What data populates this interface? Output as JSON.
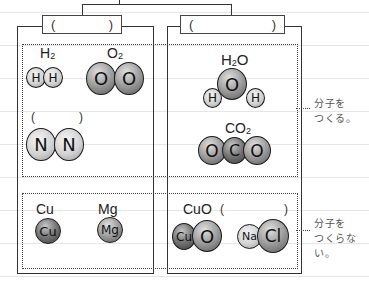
{
  "diagram": {
    "top_connector": "tree-branch",
    "left_column": {
      "header_blank": {
        "open": "(",
        "close": ")"
      },
      "molecule_section": {
        "items": [
          {
            "formula_main": "H",
            "formula_sub": "2",
            "atoms": [
              "H",
              "H"
            ]
          },
          {
            "formula_main": "O",
            "formula_sub": "2",
            "atoms": [
              "O",
              "O"
            ]
          },
          {
            "formula_blank": {
              "open": "(",
              "close": ")"
            },
            "atoms": [
              "N",
              "N"
            ]
          }
        ]
      },
      "non_molecule_section": {
        "items": [
          {
            "formula": "Cu",
            "atoms": [
              "Cu"
            ]
          },
          {
            "formula": "Mg",
            "atoms": [
              "Mg"
            ]
          }
        ]
      }
    },
    "right_column": {
      "header_blank": {
        "open": "(",
        "close": ")"
      },
      "molecule_section": {
        "items": [
          {
            "formula_parts": [
              "H",
              "2",
              "O"
            ],
            "atoms": [
              "H",
              "O",
              "H"
            ]
          },
          {
            "formula_parts": [
              "CO",
              "2"
            ],
            "atoms": [
              "O",
              "C",
              "O"
            ]
          }
        ]
      },
      "non_molecule_section": {
        "items": [
          {
            "formula": "CuO",
            "blank": {
              "open": "(",
              "close": ")"
            },
            "atoms": [
              "Cu",
              "O"
            ]
          },
          {
            "atoms": [
              "Na",
              "Cl"
            ]
          }
        ]
      }
    },
    "side_labels": {
      "molecule": [
        "分子を",
        "つくる。"
      ],
      "non_molecule": [
        "分子を",
        "つくらない。"
      ]
    }
  }
}
